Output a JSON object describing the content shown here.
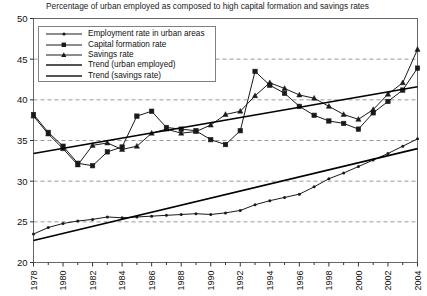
{
  "chart_data": {
    "type": "line",
    "title": "Percentage of urban employed as composed to high capital formation and savings rates",
    "xlabel": "",
    "ylabel": "",
    "xlim": [
      1978,
      2004
    ],
    "ylim": [
      20,
      50
    ],
    "yticks": [
      20,
      25,
      30,
      35,
      40,
      45,
      50
    ],
    "xticks": [
      1978,
      1980,
      1982,
      1984,
      1986,
      1988,
      1990,
      1992,
      1994,
      1996,
      1998,
      2000,
      2002,
      2004
    ],
    "xtick_labels": [
      "1978",
      "1980",
      "1982",
      "1984",
      "1986",
      "1988",
      "1990",
      "1992",
      "1994",
      "1996",
      "1998",
      "2000",
      "2002",
      "2004"
    ],
    "ytick_labels": [
      "20",
      "25",
      "30",
      "35",
      "40",
      "45",
      "50"
    ],
    "minor_xticks_every": 1,
    "grid": "horizontal-dashed",
    "legend_position": "upper-left-inside",
    "x": [
      1978,
      1979,
      1980,
      1981,
      1982,
      1983,
      1984,
      1985,
      1986,
      1987,
      1988,
      1989,
      1990,
      1991,
      1992,
      1993,
      1994,
      1995,
      1996,
      1997,
      1998,
      1999,
      2000,
      2001,
      2002,
      2003,
      2004
    ],
    "series": [
      {
        "name": "Employment rate in urban areas",
        "marker": "dot",
        "values": [
          23.5,
          24.3,
          24.8,
          25.1,
          25.3,
          25.6,
          25.5,
          25.6,
          25.7,
          25.8,
          25.9,
          26.0,
          25.9,
          26.1,
          26.4,
          27.1,
          27.6,
          28.0,
          28.4,
          29.3,
          30.3,
          31.0,
          31.8,
          32.6,
          33.4,
          34.3,
          35.2
        ]
      },
      {
        "name": "Capital formation rate",
        "marker": "square",
        "values": [
          38.2,
          36.0,
          34.3,
          32.2,
          31.9,
          33.6,
          34.2,
          38.0,
          38.6,
          36.6,
          36.4,
          36.2,
          35.1,
          34.5,
          36.2,
          43.5,
          41.8,
          40.8,
          39.2,
          38.1,
          37.4,
          37.1,
          36.4,
          38.4,
          39.8,
          41.2,
          43.9
        ]
      },
      {
        "name": "Savings rate",
        "marker": "triangle",
        "values": [
          38.0,
          35.8,
          34.0,
          32.0,
          34.4,
          34.7,
          33.9,
          34.3,
          35.9,
          36.4,
          35.9,
          36.1,
          36.9,
          38.2,
          38.6,
          40.5,
          42.1,
          41.4,
          40.6,
          40.2,
          39.2,
          38.2,
          37.6,
          38.8,
          40.7,
          42.1,
          46.2
        ]
      }
    ],
    "trend_lines": [
      {
        "name": "Trend (urban employed)",
        "x": [
          1978,
          2004
        ],
        "y": [
          22.7,
          34.0
        ]
      },
      {
        "name": "Trend (savings rate)",
        "x": [
          1978,
          2004
        ],
        "y": [
          33.4,
          41.6
        ]
      }
    ],
    "legend": [
      {
        "label": "Employment rate in urban areas",
        "symbol": "line-dot"
      },
      {
        "label": "Capital formation rate",
        "symbol": "line-square"
      },
      {
        "label": "Savings rate",
        "symbol": "line-triangle"
      },
      {
        "label": "Trend (urban employed)",
        "symbol": "line-plain"
      },
      {
        "label": "Trend (savings rate)",
        "symbol": "line-plain"
      }
    ],
    "colors": {
      "series_line": "#1a1a1a",
      "trend_line": "#000000",
      "grid": "#999999",
      "axis": "#555555",
      "background": "#ffffff"
    }
  }
}
